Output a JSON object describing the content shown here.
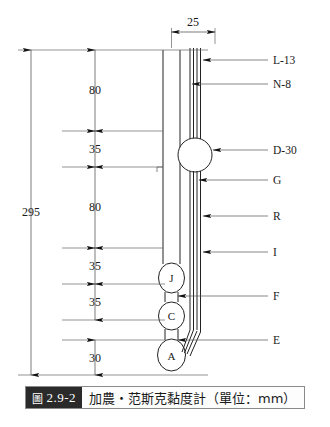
{
  "figure": {
    "caption_tag_glyph": "圖",
    "caption_number": "2.9-2",
    "caption_text": "加農・范斯克黏度計（單位：mm）",
    "title_alt": "Cannon-Fenske viscometer (unit: mm)"
  },
  "dimensions": {
    "overall": "295",
    "top_width": "25",
    "chain": [
      "80",
      "35",
      "80",
      "35",
      "35",
      "30"
    ]
  },
  "labels": {
    "right": [
      "L-13",
      "N-8",
      "D-30",
      "G",
      "R",
      "I",
      "F",
      "E"
    ],
    "bulbs": [
      "J",
      "C",
      "A"
    ]
  },
  "colors": {
    "ink": "#1a1a1a",
    "line": "#333333",
    "dim": "#555555",
    "tag_bg": "#2a2a2a",
    "paper": "#ffffff"
  }
}
